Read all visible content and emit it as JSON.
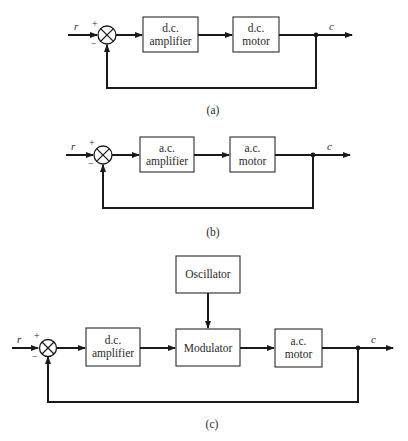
{
  "diagrams": {
    "a": {
      "caption": "(a)",
      "input_signal": "r",
      "output_signal": "c",
      "plus_sign": "+",
      "minus_sign": "−",
      "blocks": [
        {
          "line1": "d.c.",
          "line2": "amplifier"
        },
        {
          "line1": "d.c.",
          "line2": "motor"
        }
      ]
    },
    "b": {
      "caption": "(b)",
      "input_signal": "r",
      "output_signal": "c",
      "plus_sign": "+",
      "minus_sign": "−",
      "blocks": [
        {
          "line1": "a.c.",
          "line2": "amplifier"
        },
        {
          "line1": "a.c.",
          "line2": "motor"
        }
      ]
    },
    "c": {
      "caption": "(c)",
      "input_signal": "r",
      "output_signal": "c",
      "plus_sign": "+",
      "minus_sign": "−",
      "oscillator": "Oscillator",
      "blocks": [
        {
          "line1": "d.c.",
          "line2": "amplifier"
        },
        {
          "line1": "Modulator"
        },
        {
          "line1": "a.c.",
          "line2": "motor"
        }
      ]
    }
  }
}
